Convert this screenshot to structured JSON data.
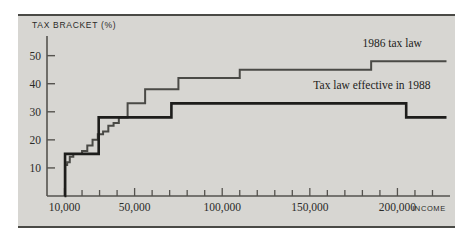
{
  "chart_data": {
    "type": "line",
    "title": "TAX BRACKET (%)",
    "xlabel": "INCOME",
    "ylabel": "TAX BRACKET (%)",
    "xlim": [
      0,
      230000
    ],
    "ylim": [
      0,
      57
    ],
    "grid": false,
    "legend": "inline annotations at right of each step curve",
    "x_ticks_major": [
      10000,
      50000,
      100000,
      150000,
      200000
    ],
    "x_tick_labels": [
      "10,000",
      "50,000",
      "100,000",
      "150,000",
      "200,000"
    ],
    "x_tick_minor_step": 10000,
    "y_ticks": [
      10,
      20,
      30,
      40,
      50
    ],
    "y_tick_labels": [
      "10",
      "20",
      "30",
      "40",
      "50"
    ],
    "series": [
      {
        "name": "1986 tax law",
        "label": "1986 tax law",
        "label_x": 180000,
        "label_y": 53,
        "color": "#4a4a46",
        "step_points": [
          {
            "income": 10000,
            "rate": 0
          },
          {
            "income": 10400,
            "rate": 11
          },
          {
            "income": 11500,
            "rate": 12
          },
          {
            "income": 13000,
            "rate": 14
          },
          {
            "income": 15000,
            "rate": 15
          },
          {
            "income": 20000,
            "rate": 16
          },
          {
            "income": 23000,
            "rate": 18
          },
          {
            "income": 26000,
            "rate": 20
          },
          {
            "income": 29000,
            "rate": 22
          },
          {
            "income": 32000,
            "rate": 23
          },
          {
            "income": 35000,
            "rate": 25
          },
          {
            "income": 38000,
            "rate": 26
          },
          {
            "income": 41000,
            "rate": 28
          },
          {
            "income": 46000,
            "rate": 33
          },
          {
            "income": 56000,
            "rate": 38
          },
          {
            "income": 75000,
            "rate": 42
          },
          {
            "income": 110000,
            "rate": 45
          },
          {
            "income": 185000,
            "rate": 48
          },
          {
            "income": 228000,
            "rate": 48
          }
        ]
      },
      {
        "name": "Tax law effective in 1988",
        "label": "Tax law effective in 1988",
        "label_x": 152000,
        "label_y": 38,
        "color": "#1d1d1b",
        "step_points": [
          {
            "income": 10000,
            "rate": 0
          },
          {
            "income": 10300,
            "rate": 15
          },
          {
            "income": 29500,
            "rate": 15
          },
          {
            "income": 29500,
            "rate": 28
          },
          {
            "income": 45000,
            "rate": 28
          },
          {
            "income": 71000,
            "rate": 33
          },
          {
            "income": 205000,
            "rate": 33
          },
          {
            "income": 205000,
            "rate": 28
          },
          {
            "income": 228000,
            "rate": 28
          }
        ]
      }
    ]
  }
}
